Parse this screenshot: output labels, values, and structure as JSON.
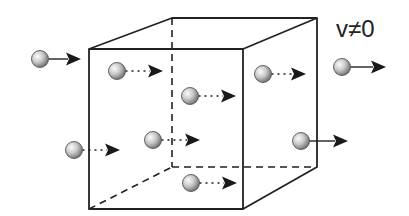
{
  "label": "v≠0",
  "colors": {
    "line": "#222222",
    "background": "#ffffff",
    "particle_light": "#f2f2f2",
    "particle_dark": "#6f6f6f"
  },
  "cube": {
    "front": {
      "x1": 89,
      "y1": 49,
      "x2": 243,
      "y2": 209
    },
    "back": {
      "x1": 172,
      "y1": 18,
      "x2": 317,
      "y2": 167
    }
  },
  "particles": [
    {
      "id": "outside-left",
      "cx": 40,
      "cy": 59,
      "arrow_to": 81,
      "style": "solid",
      "location": "outside"
    },
    {
      "id": "inside-1",
      "cx": 117,
      "cy": 71,
      "arrow_to": 163,
      "style": "dotted",
      "location": "inside"
    },
    {
      "id": "inside-2",
      "cx": 190,
      "cy": 96,
      "arrow_to": 236,
      "style": "dotted",
      "location": "inside"
    },
    {
      "id": "inside-3",
      "cx": 263,
      "cy": 74,
      "arrow_to": 306,
      "style": "dotted",
      "location": "inside"
    },
    {
      "id": "inside-4",
      "cx": 74,
      "cy": 150,
      "arrow_to": 120,
      "style": "dotted",
      "location": "inside"
    },
    {
      "id": "inside-5",
      "cx": 153,
      "cy": 140,
      "arrow_to": 200,
      "style": "dotted",
      "location": "inside"
    },
    {
      "id": "inside-6",
      "cx": 191,
      "cy": 183,
      "arrow_to": 237,
      "style": "dotted",
      "location": "inside"
    },
    {
      "id": "outside-right-top",
      "cx": 342,
      "cy": 67,
      "arrow_to": 386,
      "style": "solid",
      "location": "outside"
    },
    {
      "id": "outside-right-bottom",
      "cx": 301,
      "cy": 141,
      "arrow_to": 348,
      "style": "solid",
      "location": "outside"
    }
  ]
}
